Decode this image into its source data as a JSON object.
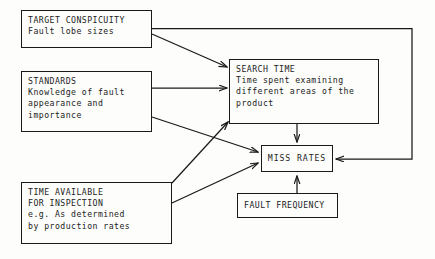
{
  "diagram": {
    "background_color": "#fdfdfc",
    "ink_color": "#1a1a1a",
    "nodes": [
      {
        "id": "target-conspicuity",
        "lines": [
          "TARGET CONSPICUITY",
          "Fault lobe sizes"
        ]
      },
      {
        "id": "standards",
        "lines": [
          "STANDARDS",
          "Knowledge of fault",
          "appearance and",
          "importance"
        ]
      },
      {
        "id": "time-available",
        "lines": [
          "TIME AVAILABLE",
          "FOR INSPECTION",
          "e.g. As determined",
          "by production rates"
        ]
      },
      {
        "id": "search-time",
        "lines": [
          "SEARCH TIME",
          "Time spent examining",
          "different areas of the",
          "product"
        ]
      },
      {
        "id": "miss-rates",
        "lines": [
          "MISS RATES"
        ]
      },
      {
        "id": "fault-frequency",
        "lines": [
          "FAULT FREQUENCY"
        ]
      }
    ],
    "edges": [
      {
        "id": "target-to-searchtime",
        "from": "target-conspicuity",
        "to": "search-time"
      },
      {
        "id": "target-to-missrates",
        "from": "target-conspicuity",
        "to": "miss-rates"
      },
      {
        "id": "standards-to-searchtime",
        "from": "standards",
        "to": "search-time"
      },
      {
        "id": "standards-to-missrates",
        "from": "standards",
        "to": "miss-rates"
      },
      {
        "id": "timeavail-to-searchtime",
        "from": "time-available",
        "to": "search-time"
      },
      {
        "id": "timeavail-to-missrates",
        "from": "time-available",
        "to": "miss-rates"
      },
      {
        "id": "searchtime-to-missrates",
        "from": "search-time",
        "to": "miss-rates"
      },
      {
        "id": "faultfreq-to-missrates",
        "from": "fault-frequency",
        "to": "miss-rates"
      }
    ]
  }
}
